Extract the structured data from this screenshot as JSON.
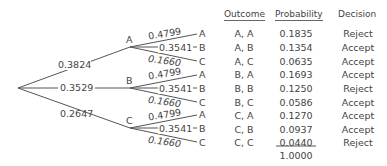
{
  "tree": {
    "first_stage": [
      {
        "node": "A",
        "prob": "0.3824"
      },
      {
        "node": "B",
        "prob": "0.3529"
      },
      {
        "node": "C",
        "prob": "0.2647"
      }
    ],
    "second_stage": [
      {
        "label": "A",
        "prob": "0.4799"
      },
      {
        "label": "B",
        "prob": "0.3541"
      },
      {
        "label": "C",
        "prob": "0.1660"
      }
    ]
  },
  "table": {
    "headers": {
      "outcome": "Outcome",
      "probability": "Probability",
      "decision": "Decision"
    },
    "rows": [
      {
        "outcome": "A, A",
        "probability": "0.1835",
        "decision": "Reject"
      },
      {
        "outcome": "A, B",
        "probability": "0.1354",
        "decision": "Accept"
      },
      {
        "outcome": "A, C",
        "probability": "0.0635",
        "decision": "Accept"
      },
      {
        "outcome": "B, A",
        "probability": "0.1693",
        "decision": "Accept"
      },
      {
        "outcome": "B, B",
        "probability": "0.1250",
        "decision": "Reject"
      },
      {
        "outcome": "B, C",
        "probability": "0.0586",
        "decision": "Accept"
      },
      {
        "outcome": "C, A",
        "probability": "0.1270",
        "decision": "Accept"
      },
      {
        "outcome": "C, B",
        "probability": "0.0937",
        "decision": "Accept"
      },
      {
        "outcome": "C, C",
        "probability": "0.0440",
        "decision": "Reject"
      }
    ],
    "total": "1.0000"
  }
}
